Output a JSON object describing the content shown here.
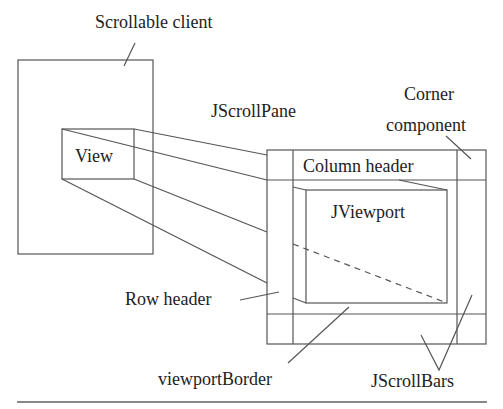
{
  "diagram": {
    "labels": {
      "scrollable_client": "Scrollable client",
      "view": "View",
      "jscrollpane": "JScrollPane",
      "corner_line1": "Corner",
      "corner_line2": "component",
      "column_header": "Column header",
      "jviewport": "JViewport",
      "row_header": "Row header",
      "viewport_border": "viewportBorder",
      "jscrollbars": "JScrollBars"
    },
    "colors": {
      "line": "#555555",
      "text": "#222222",
      "rule": "#888888",
      "background": "#ffffff"
    }
  }
}
